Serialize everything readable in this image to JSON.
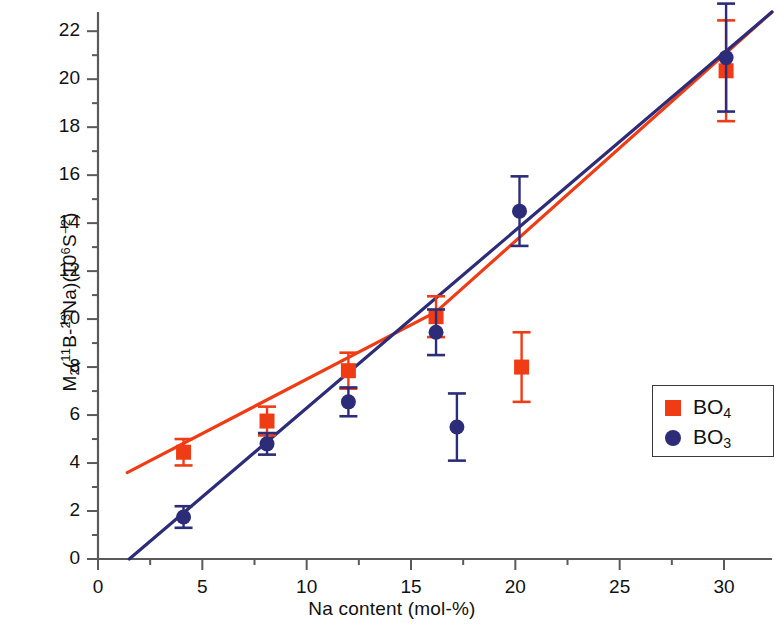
{
  "chart_data": {
    "type": "scatter",
    "title": "",
    "xlabel": "Na content (mol-%)",
    "ylabel": "M2(11B-23Na)(10^6 S^-2)",
    "ylabel_parts": {
      "m": "M",
      "m_sub": "2",
      "open": "(",
      "iso1_sup": "11",
      "iso1": "B-",
      "iso2_sup": "23",
      "iso2": "Na)(10",
      "exp6": "6",
      "s": "S",
      "expm2": "−2",
      "close": ")"
    },
    "xlim": [
      0,
      32.3
    ],
    "ylim": [
      0,
      22.8
    ],
    "xticks": [
      0,
      5,
      10,
      15,
      20,
      25,
      30
    ],
    "xticklabels": [
      "0",
      "5",
      "10",
      "15",
      "20",
      "25",
      "30"
    ],
    "xminor_step": 2.5,
    "yticks": [
      0,
      2,
      4,
      6,
      8,
      10,
      12,
      14,
      16,
      18,
      20,
      22
    ],
    "yticklabels": [
      "0",
      "2",
      "4",
      "6",
      "8",
      "10",
      "12",
      "14",
      "16",
      "18",
      "20",
      "22"
    ],
    "yminor_step": 1,
    "grid": false,
    "legend_position": "center-right",
    "colors": {
      "bo4": "#f03c14",
      "bo3": "#2c2c78",
      "axis": "#5a5a5a",
      "text": "#111111"
    },
    "series": [
      {
        "name": "BO4",
        "label": "BO",
        "label_sub": "4",
        "marker": "square",
        "color": "#f03c14",
        "points": [
          {
            "x": 4.1,
            "y": 4.45,
            "yerr_low": 0.55,
            "yerr_high": 0.55
          },
          {
            "x": 8.1,
            "y": 5.75,
            "yerr_low": 0.6,
            "yerr_high": 0.6
          },
          {
            "x": 12.0,
            "y": 7.85,
            "yerr_low": 0.75,
            "yerr_high": 0.75
          },
          {
            "x": 16.2,
            "y": 10.1,
            "yerr_low": 0.85,
            "yerr_high": 0.85
          },
          {
            "x": 20.3,
            "y": 8.0,
            "yerr_low": 1.45,
            "yerr_high": 1.45
          },
          {
            "x": 30.1,
            "y": 20.35,
            "yerr_low": 2.1,
            "yerr_high": 2.1
          }
        ],
        "fit_line": [
          {
            "x": 1.4,
            "y": 3.6
          },
          {
            "x": 16.2,
            "y": 10.3
          },
          {
            "x": 32.3,
            "y": 22.8
          }
        ]
      },
      {
        "name": "BO3",
        "label": "BO",
        "label_sub": "3",
        "marker": "circle",
        "color": "#2c2c78",
        "points": [
          {
            "x": 4.1,
            "y": 1.75,
            "yerr_low": 0.45,
            "yerr_high": 0.45
          },
          {
            "x": 8.1,
            "y": 4.8,
            "yerr_low": 0.45,
            "yerr_high": 0.45
          },
          {
            "x": 12.0,
            "y": 6.55,
            "yerr_low": 0.6,
            "yerr_high": 0.6
          },
          {
            "x": 16.2,
            "y": 9.45,
            "yerr_low": 0.95,
            "yerr_high": 0.95
          },
          {
            "x": 17.2,
            "y": 5.5,
            "yerr_low": 1.4,
            "yerr_high": 1.4
          },
          {
            "x": 20.2,
            "y": 14.5,
            "yerr_low": 1.45,
            "yerr_high": 1.45
          },
          {
            "x": 30.1,
            "y": 20.9,
            "yerr_low": 2.25,
            "yerr_high": 2.25
          }
        ],
        "fit_line": [
          {
            "x": 1.5,
            "y": 0.0
          },
          {
            "x": 32.3,
            "y": 22.8
          }
        ]
      }
    ]
  }
}
